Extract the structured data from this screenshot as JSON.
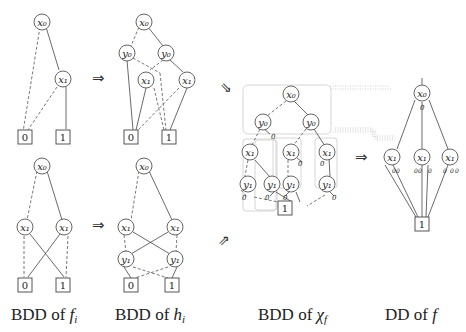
{
  "captions": {
    "fi": "BDD of ",
    "fi_math": "f",
    "fi_sub": "i",
    "hi": "BDD of ",
    "hi_math": "h",
    "hi_sub": "i",
    "chi": "BDD of ",
    "chi_math": "χ",
    "chi_sub": "f",
    "dd": "DD of ",
    "dd_math": "f"
  },
  "labels": {
    "x0": "x₀",
    "x1": "x₁",
    "y0": "y₀",
    "y1": "y₁",
    "zero": "0",
    "one": "1",
    "small_zero": "0"
  },
  "arrows": {
    "right": "⇒",
    "down_right": "⇘",
    "up_right": "⇗"
  }
}
